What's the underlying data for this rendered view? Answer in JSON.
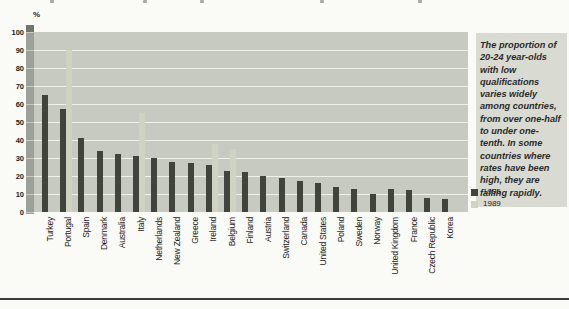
{
  "colors": {
    "page_bg": "#fafaf7",
    "plot_bg": "#c7cac1",
    "gridline": "#eef0e9",
    "bar_1995": "#40443d",
    "bar_1989": "#d0d3c1",
    "axis_band": "#9ba198",
    "axis_band_notch": "#c4c8bd",
    "axis_band_cap": "#70766c",
    "panel_bg": "#d9dbd3",
    "text": "#1c1c1c",
    "rule": "#3c3c3c",
    "speck": "#a9a9a4"
  },
  "caption": {
    "text": "The proportion of 20-24 year-olds with low qualifications varies widely among countries, from over one-half to under one-tenth. In some countries where rates have been high, they are falling rapidly."
  },
  "chart_data": {
    "type": "bar",
    "unit_label": "%",
    "title": "",
    "xlabel": "",
    "ylabel": "%",
    "ylim": [
      0,
      100
    ],
    "yticks": [
      0,
      10,
      20,
      30,
      40,
      50,
      60,
      70,
      80,
      90,
      100
    ],
    "grid": "horizontal white gridlines on shaded plot background",
    "legend_position": "right, below caption panel",
    "categories": [
      "Turkey",
      "Portugal",
      "Spain",
      "Denmark",
      "Australia",
      "Italy",
      "Netherlands",
      "New Zealand",
      "Greece",
      "Ireland",
      "Belgium",
      "Finland",
      "Austria",
      "Switzerland",
      "Canada",
      "United States",
      "Poland",
      "Sweden",
      "Norway",
      "United Kingdom",
      "France",
      "Czech Republic",
      "Korea"
    ],
    "series": [
      {
        "name": "1995",
        "color": "#40443d",
        "values": [
          65,
          57,
          41,
          34,
          32,
          31,
          30,
          28,
          27,
          26,
          23,
          22,
          20,
          19,
          17,
          16,
          14,
          13,
          10,
          13,
          12,
          8,
          7
        ]
      },
      {
        "name": "1989",
        "color": "#d0d3c1",
        "values": [
          null,
          90,
          null,
          null,
          null,
          55,
          null,
          null,
          null,
          38,
          35,
          null,
          null,
          null,
          null,
          null,
          null,
          null,
          null,
          null,
          null,
          null,
          null
        ]
      }
    ]
  }
}
